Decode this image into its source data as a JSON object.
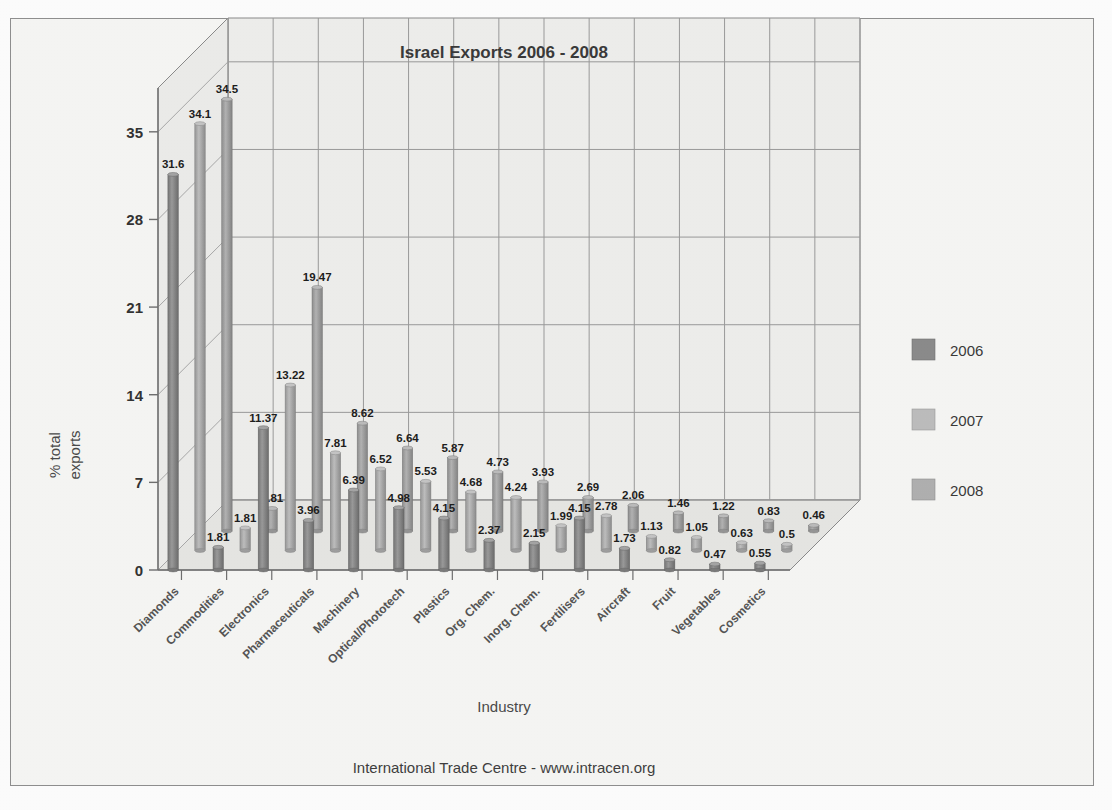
{
  "chart_data": {
    "type": "bar",
    "title": "Israel Exports  2006 - 2008",
    "xlabel": "Industry",
    "ylabel": "% total exports",
    "ylim": [
      0,
      38.5
    ],
    "yticks": [
      0,
      7,
      14,
      21,
      28,
      35
    ],
    "ytick_labels": [
      "0",
      "7",
      "14",
      "21",
      "28",
      "35"
    ],
    "grid": true,
    "legend_position": "right",
    "projection": "3d-bars",
    "categories": [
      "Diamonds",
      "Commodities",
      "Electronics",
      "Pharmaceuticals",
      "Machinery",
      "Optical/Phototech",
      "Plastics",
      "Org. Chem.",
      "Inorg. Chem.",
      "Fertilisers",
      "Aircraft",
      "Fruit",
      "Vegetables",
      "Cosmetics"
    ],
    "series": [
      {
        "name": "2006",
        "color": "#8c8c8c",
        "values": [
          31.6,
          1.81,
          11.37,
          3.96,
          6.39,
          4.98,
          4.15,
          2.37,
          2.15,
          4.15,
          1.73,
          0.82,
          0.47,
          0.55
        ]
      },
      {
        "name": "2007",
        "color": "#b5b5b5",
        "values": [
          34.1,
          1.81,
          13.22,
          7.81,
          6.52,
          5.53,
          4.68,
          4.24,
          1.99,
          2.78,
          1.13,
          1.05,
          0.63,
          0.5
        ]
      },
      {
        "name": "2008",
        "color": "#a9a9a9",
        "values": [
          34.5,
          1.81,
          19.47,
          8.62,
          6.64,
          5.87,
          4.73,
          3.93,
          2.69,
          2.06,
          1.46,
          1.22,
          0.83,
          0.46
        ]
      }
    ]
  },
  "legend": {
    "entries": [
      {
        "label": "2006",
        "color": "#8b8b8b"
      },
      {
        "label": "2007",
        "color": "#bdbdbd"
      },
      {
        "label": "2008",
        "color": "#b0b0b0"
      }
    ]
  },
  "footer": {
    "credit": "International Trade Centre -  www.intracen.org"
  },
  "colors": {
    "background": "#f6f6f4",
    "plot_face": "#e9e9e7",
    "grid": "#9a9a9a",
    "axis": "#7c7c7c",
    "text": "#333333"
  }
}
